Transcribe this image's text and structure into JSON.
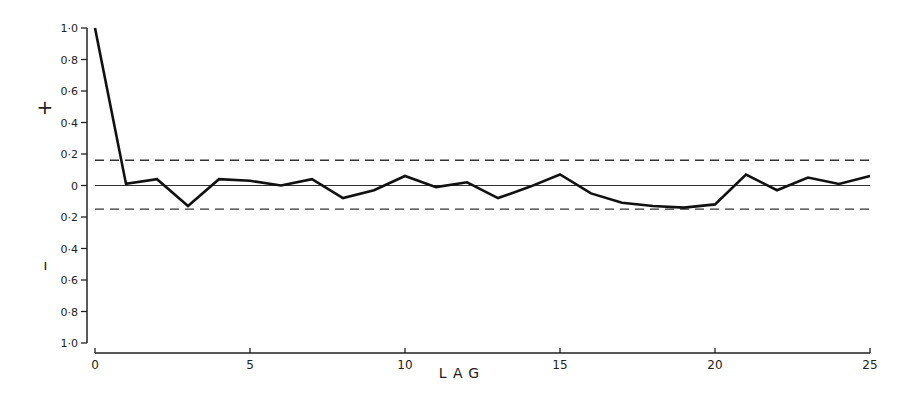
{
  "chart_data": {
    "type": "line",
    "title": "",
    "xlabel": "LAG",
    "ylabel_positive": "+",
    "ylabel_negative": "–",
    "x": [
      0,
      1,
      2,
      3,
      4,
      5,
      6,
      7,
      8,
      9,
      10,
      11,
      12,
      13,
      14,
      15,
      16,
      17,
      18,
      19,
      20,
      21,
      22,
      23,
      24,
      25
    ],
    "values": [
      1.0,
      0.01,
      0.04,
      -0.13,
      0.04,
      0.03,
      0.0,
      0.04,
      -0.08,
      -0.03,
      0.06,
      -0.01,
      0.02,
      -0.08,
      -0.01,
      0.07,
      -0.05,
      -0.11,
      -0.13,
      -0.14,
      -0.12,
      0.07,
      -0.03,
      0.05,
      0.01,
      0.06
    ],
    "confidence_limits": {
      "upper": 0.16,
      "lower": -0.15,
      "style": "dashed"
    },
    "zero_line": 0,
    "xlim": [
      0,
      25
    ],
    "ylim": [
      -1.0,
      1.0
    ],
    "x_ticks": [
      0,
      5,
      10,
      15,
      20,
      25
    ],
    "x_tick_labels": [
      "0",
      "5",
      "10",
      "15",
      "20",
      "25"
    ],
    "y_ticks": [
      1.0,
      0.8,
      0.6,
      0.4,
      0.2,
      0,
      -0.2,
      -0.4,
      -0.6,
      -0.8,
      -1.0
    ],
    "y_tick_labels": [
      "1·0",
      "0·8",
      "0·6",
      "0·4",
      "0·2",
      "0",
      "0·2",
      "0·4",
      "0·6",
      "0·8",
      "1·0"
    ],
    "grid": false,
    "legend": null
  }
}
